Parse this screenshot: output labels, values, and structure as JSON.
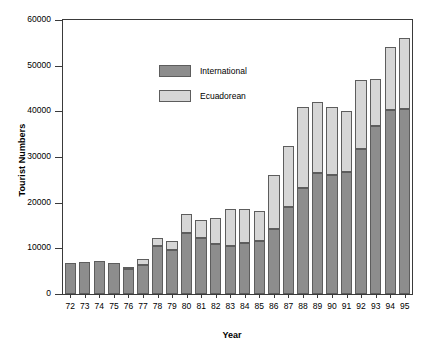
{
  "chart_data": {
    "type": "bar",
    "subtype": "stacked-vertical",
    "title": "",
    "xlabel": "Year",
    "ylabel": "Tourist Numbers",
    "ylim": [
      0,
      60000
    ],
    "yticks": [
      0,
      10000,
      20000,
      30000,
      40000,
      50000,
      60000
    ],
    "ytick_labels": [
      "0",
      "10000",
      "20000",
      "30000",
      "40000",
      "50000",
      "60000"
    ],
    "grid": false,
    "legend_position": "upper-left-inside",
    "categories": [
      "72",
      "73",
      "74",
      "75",
      "76",
      "77",
      "78",
      "79",
      "80",
      "81",
      "82",
      "83",
      "84",
      "85",
      "86",
      "87",
      "88",
      "89",
      "90",
      "91",
      "92",
      "93",
      "94",
      "95"
    ],
    "series": [
      {
        "name": "International",
        "color": "#8d8d8d",
        "values": [
          6700,
          7000,
          7300,
          6900,
          5400,
          6300,
          10600,
          9600,
          13400,
          12200,
          11000,
          10500,
          11200,
          11500,
          14300,
          19100,
          23300,
          26600,
          26000,
          26800,
          31800,
          36700,
          40300,
          40500
        ]
      },
      {
        "name": "Ecuadorean",
        "color": "#d6d6d6",
        "values": [
          0,
          0,
          0,
          0,
          600,
          1400,
          1600,
          2000,
          4200,
          4000,
          5600,
          8100,
          7500,
          6700,
          11700,
          13400,
          17700,
          15400,
          15000,
          13300,
          15100,
          10300,
          13700,
          15500
        ]
      }
    ],
    "totals": [
      6700,
      7000,
      7300,
      6900,
      6000,
      7700,
      12200,
      11600,
      17600,
      16200,
      16600,
      18600,
      18700,
      18200,
      26000,
      32500,
      41000,
      42000,
      41000,
      40100,
      46900,
      47000,
      54000,
      56000
    ]
  },
  "legend": {
    "items": [
      {
        "label": "International",
        "color": "#8d8d8d"
      },
      {
        "label": "Ecuadorean",
        "color": "#d6d6d6"
      }
    ]
  },
  "axes": {
    "ylabel": "Tourist Numbers",
    "xlabel": "Year"
  }
}
